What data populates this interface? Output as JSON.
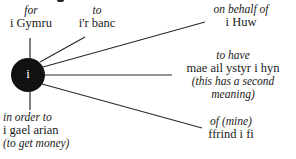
{
  "diagram": {
    "hub": {
      "letter": "i",
      "color": "#111111"
    },
    "line_color": "#2a2a2a",
    "branches": [
      {
        "id": "for",
        "gloss": "for",
        "welsh": "i Gymru",
        "note": ""
      },
      {
        "id": "to",
        "gloss": "to",
        "welsh": "i'r banc",
        "note": ""
      },
      {
        "id": "on-behalf-of",
        "gloss": "on behalf of",
        "welsh": "i Huw",
        "note": ""
      },
      {
        "id": "to-have",
        "gloss": "to have",
        "welsh": "mae ail ystyr i hyn",
        "note": "(this has a second meaning)"
      },
      {
        "id": "of-mine",
        "gloss": "of (mine)",
        "welsh": "ffrind i fi",
        "note": ""
      },
      {
        "id": "in-order-to",
        "gloss": "in order to",
        "welsh": "i gael arian",
        "note": "(to get money)"
      }
    ]
  }
}
